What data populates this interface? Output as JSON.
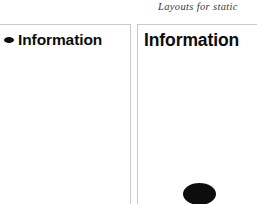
{
  "header": {
    "running_title": "Layouts for static"
  },
  "panels": {
    "left": {
      "name": "information-panel-bulleted",
      "bullet_icon": "bullet-ellipse-icon",
      "heading": "Information"
    },
    "right": {
      "name": "information-panel-plain",
      "heading": "Information",
      "shape_icon": "filled-ellipse-icon"
    }
  },
  "colors": {
    "ink": "#0d0d0d",
    "panel_border": "#c9c9c9",
    "background": "#ffffff",
    "header_text": "#3a3a3a"
  }
}
